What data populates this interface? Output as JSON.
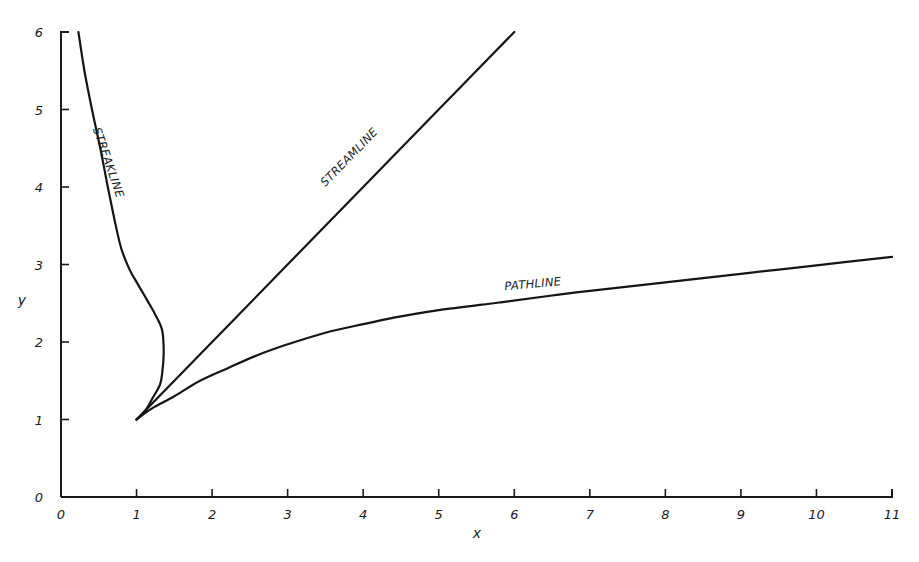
{
  "chart_data": {
    "type": "line",
    "title": "",
    "xlabel": "x",
    "ylabel": "y",
    "xlim": [
      0,
      11
    ],
    "ylim": [
      0,
      6
    ],
    "grid": false,
    "legend": "none (curves labelled inline)",
    "x_ticks": [
      "0",
      "1",
      "2",
      "3",
      "4",
      "5",
      "6",
      "7",
      "8",
      "9",
      "10",
      "11"
    ],
    "y_ticks": [
      "0",
      "1",
      "2",
      "3",
      "4",
      "5",
      "6"
    ],
    "series": [
      {
        "name": "STREAMLINE",
        "label": "STREAMLINE",
        "points": [
          [
            1,
            1
          ],
          [
            2,
            2
          ],
          [
            3,
            3
          ],
          [
            4,
            4
          ],
          [
            5,
            5
          ],
          [
            6,
            6
          ]
        ]
      },
      {
        "name": "PATHLINE",
        "label": "PATHLINE",
        "points": [
          [
            1,
            1
          ],
          [
            1.2,
            1.14
          ],
          [
            1.5,
            1.3
          ],
          [
            1.84,
            1.5
          ],
          [
            2.2,
            1.66
          ],
          [
            2.6,
            1.83
          ],
          [
            3.0,
            1.97
          ],
          [
            3.5,
            2.12
          ],
          [
            4.0,
            2.23
          ],
          [
            4.5,
            2.33
          ],
          [
            5.0,
            2.41
          ],
          [
            5.8,
            2.51
          ],
          [
            6.5,
            2.6
          ],
          [
            7.0,
            2.66
          ],
          [
            8.0,
            2.77
          ],
          [
            9.0,
            2.88
          ],
          [
            10.0,
            2.99
          ],
          [
            11.0,
            3.1
          ]
        ]
      },
      {
        "name": "STREAKLINE",
        "label": "STREAKLINE",
        "points": [
          [
            1,
            1
          ],
          [
            1.12,
            1.12
          ],
          [
            1.22,
            1.29
          ],
          [
            1.31,
            1.45
          ],
          [
            1.34,
            1.6
          ],
          [
            1.36,
            1.86
          ],
          [
            1.34,
            2.15
          ],
          [
            1.25,
            2.35
          ],
          [
            1.14,
            2.54
          ],
          [
            1.02,
            2.74
          ],
          [
            0.91,
            2.93
          ],
          [
            0.8,
            3.2
          ],
          [
            0.71,
            3.57
          ],
          [
            0.62,
            4.0
          ],
          [
            0.52,
            4.5
          ],
          [
            0.41,
            5.0
          ],
          [
            0.31,
            5.5
          ],
          [
            0.23,
            6.0
          ]
        ]
      }
    ],
    "annotations": [
      {
        "text": "STREAMLINE",
        "x": 3.85,
        "y": 4.35,
        "rotation": -45.7
      },
      {
        "text": "PATHLINE",
        "x": 6.25,
        "y": 2.7,
        "rotation": -5.2
      },
      {
        "text": "STREAKLINE",
        "x": 0.58,
        "y": 4.3,
        "rotation": 71
      }
    ]
  }
}
